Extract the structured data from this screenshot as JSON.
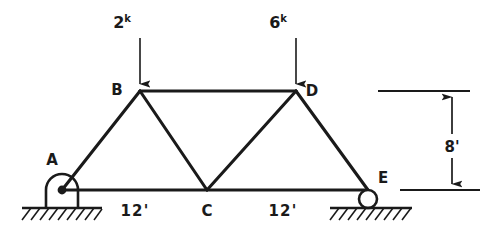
{
  "figure": {
    "background_color": "#ffffff",
    "ink_color": "#1a1a1a"
  },
  "loads": [
    {
      "id": "load-at-B",
      "magnitude": "2",
      "unit_superscript": "k",
      "applied_at": "B",
      "direction": "down",
      "label_x": 131,
      "label_y": 28,
      "arrow_x": 140,
      "arrow_top_y": 38,
      "arrow_tip_y": 89
    },
    {
      "id": "load-at-D",
      "magnitude": "6",
      "unit_superscript": "k",
      "applied_at": "D",
      "direction": "down",
      "label_x": 287,
      "label_y": 28,
      "arrow_x": 296,
      "arrow_top_y": 38,
      "arrow_tip_y": 89
    }
  ],
  "joints": [
    {
      "id": "A",
      "label": "A",
      "x": 62,
      "y": 190,
      "label_x": 52,
      "label_y": 165,
      "support": "pin"
    },
    {
      "id": "B",
      "label": "B",
      "x": 140,
      "y": 91,
      "label_x": 117,
      "label_y": 94,
      "support": "none"
    },
    {
      "id": "C",
      "label": "C",
      "x": 207,
      "y": 190,
      "label_x": 202,
      "label_y": 214,
      "support": "none"
    },
    {
      "id": "D",
      "label": "D",
      "x": 296,
      "y": 91,
      "label_x": 306,
      "label_y": 95,
      "support": "none"
    },
    {
      "id": "E",
      "label": "E",
      "x": 368,
      "y": 190,
      "label_x": 378,
      "label_y": 182,
      "support": "roller"
    }
  ],
  "members": [
    {
      "id": "A-B",
      "from": "A",
      "to": "B"
    },
    {
      "id": "B-D",
      "from": "B",
      "to": "D"
    },
    {
      "id": "B-C",
      "from": "B",
      "to": "C"
    },
    {
      "id": "C-D",
      "from": "C",
      "to": "D"
    },
    {
      "id": "D-E",
      "from": "D",
      "to": "E"
    },
    {
      "id": "A-E",
      "from": "A",
      "to": "E"
    }
  ],
  "supports": {
    "pin": {
      "at": "A",
      "type": "pin",
      "center_x": 62,
      "center_y": 190,
      "ground_y": 208,
      "ground_x1": 22,
      "ground_x2": 102
    },
    "roller": {
      "at": "E",
      "type": "roller",
      "center_x": 368,
      "center_y": 199,
      "radius": 9,
      "ground_y": 208,
      "ground_x1": 330,
      "ground_x2": 412
    }
  },
  "dimensions": [
    {
      "id": "span-A-C",
      "label": "12'",
      "value": 12,
      "unit": "ft",
      "orientation": "horizontal",
      "label_x": 135,
      "label_y": 214
    },
    {
      "id": "span-C-E",
      "label": "12'",
      "value": 12,
      "unit": "ft",
      "orientation": "horizontal",
      "label_x": 283,
      "label_y": 214
    },
    {
      "id": "height",
      "label": "8'",
      "value": 8,
      "unit": "ft",
      "orientation": "vertical",
      "label_x": 438,
      "label_y": 148,
      "arrow_x": 452,
      "top_y": 91,
      "bottom_y": 190,
      "ext_top_x1": 378,
      "ext_top_x2": 470,
      "ext_bottom_x1": 400,
      "ext_bottom_x2": 480
    }
  ]
}
